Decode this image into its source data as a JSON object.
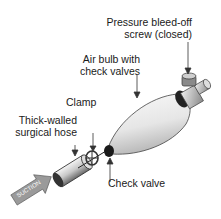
{
  "labels": {
    "pressure_screw_line1": "Pressure bleed-off",
    "pressure_screw_line2": "screw (closed)",
    "air_bulb_line1": "Air bulb with",
    "air_bulb_line2": "check valves",
    "clamp": "Clamp",
    "hose_line1": "Thick-walled",
    "hose_line2": "surgical hose",
    "check_valve": "Check valve",
    "suction_arrow": "SUCTION"
  }
}
